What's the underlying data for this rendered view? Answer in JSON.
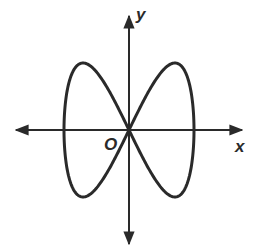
{
  "diagram": {
    "type": "parametric curve graph",
    "curve": "figure-eight (Lissajous-like) curve through the origin",
    "labels": {
      "x_axis": "x",
      "y_axis": "y",
      "origin": "O"
    },
    "colors": {
      "stroke": "#2a2a2a",
      "background": "#ffffff"
    }
  }
}
